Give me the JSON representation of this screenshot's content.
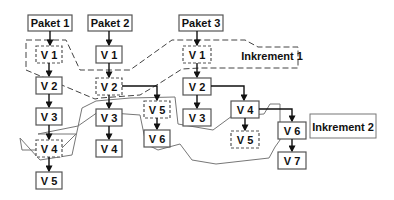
{
  "packages": [
    {
      "label": "Paket 1",
      "versions": [
        "V 1",
        "V 2",
        "V 3",
        "V 4",
        "V 5"
      ]
    },
    {
      "label": "Paket 2",
      "versions": [
        "V 1",
        "V 2",
        "V 3",
        "V 4",
        "V 5",
        "V 6"
      ]
    },
    {
      "label": "Paket 3",
      "versions": [
        "V 1",
        "V 2",
        "V 3",
        "V 4",
        "V 5",
        "V 6",
        "V 7"
      ]
    }
  ],
  "increments": [
    {
      "label": "Inkrement 1"
    },
    {
      "label": "Inkrement 2"
    }
  ]
}
